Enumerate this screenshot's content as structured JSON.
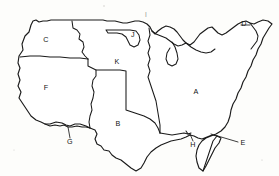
{
  "figure": {
    "name": "united-states-region-outline-map",
    "background_color": "#fdfdfb",
    "stroke_color": "#1a1a1a",
    "fill_color": "#ffffff",
    "width": 279,
    "height": 176
  },
  "labels": [
    {
      "id": "A",
      "text": "A",
      "x": 196,
      "y": 92,
      "faint": false,
      "has_leader": false
    },
    {
      "id": "B",
      "text": "B",
      "x": 118,
      "y": 124,
      "faint": false,
      "has_leader": false
    },
    {
      "id": "C",
      "text": "C",
      "x": 46,
      "y": 40,
      "faint": false,
      "has_leader": false
    },
    {
      "id": "D",
      "text": "D",
      "x": 244,
      "y": 24,
      "faint": false,
      "has_leader": true
    },
    {
      "id": "E",
      "text": "E",
      "x": 243,
      "y": 143,
      "faint": false,
      "has_leader": true
    },
    {
      "id": "F",
      "text": "F",
      "x": 46,
      "y": 88,
      "faint": false,
      "has_leader": false
    },
    {
      "id": "G",
      "text": "G",
      "x": 70,
      "y": 142,
      "faint": false,
      "has_leader": true
    },
    {
      "id": "H",
      "text": "H",
      "x": 193,
      "y": 145,
      "faint": false,
      "has_leader": true
    },
    {
      "id": "I",
      "text": "I",
      "x": 146,
      "y": 15,
      "faint": true,
      "has_leader": false
    },
    {
      "id": "J",
      "text": "J",
      "x": 133,
      "y": 35,
      "faint": false,
      "has_leader": false
    },
    {
      "id": "K",
      "text": "K",
      "x": 117,
      "y": 62,
      "faint": false,
      "has_leader": false
    }
  ],
  "leaders": [
    {
      "id": "D",
      "d": "M 241 25 L 250 25"
    },
    {
      "id": "E",
      "d": "M 238 142 L 211 134"
    },
    {
      "id": "G",
      "d": "M 70 138 L 68 127"
    },
    {
      "id": "H",
      "d": "M 193 141 L 190 134"
    }
  ]
}
